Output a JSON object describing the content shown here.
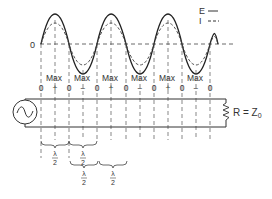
{
  "diagram": {
    "zero_label": "0",
    "legend": {
      "E_label": "E",
      "I_label": "I",
      "E_style": "solid",
      "I_style": "dashed"
    },
    "max_labels": [
      "Max",
      "Max",
      "Max",
      "Max",
      "Max",
      "Max"
    ],
    "node_labels": [
      "0",
      "+",
      "0",
      "−",
      "0",
      "+",
      "0",
      "−",
      "0",
      "+",
      "0",
      "−",
      "0"
    ],
    "load_label": "R = Z",
    "load_subscript": "0",
    "source": "ac-source",
    "brace_labels": {
      "top_row": [
        {
          "num": "λ",
          "den": "2"
        },
        {
          "num": "λ",
          "den": "2"
        }
      ],
      "bottom_row": [
        {
          "num": "λ",
          "den": "2"
        },
        {
          "num": "λ",
          "den": "2"
        }
      ]
    },
    "colors": {
      "ink": "#333333",
      "background": "#ffffff"
    }
  }
}
